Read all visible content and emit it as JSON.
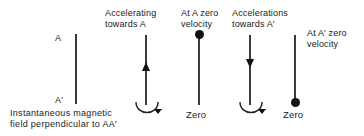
{
  "figure": {
    "type": "physics-oscillation-diagram",
    "background_color": "#ffffff",
    "line_color": "#3a3a3a",
    "marker_color": "#111111",
    "text_color": "#1a1a1a"
  },
  "caption": {
    "line1": "Instantaneous magnetic",
    "line2": "field perpendicular to AA′"
  },
  "axis_labels": {
    "top": "A",
    "bottom": "A′"
  },
  "stages": [
    {
      "id": "stage-1-reference",
      "top_label_line1": "",
      "top_label_line2": "",
      "marker": "none",
      "arrow": "none",
      "rotation_arrow": false,
      "bottom_label": ""
    },
    {
      "id": "stage-2-accelerating-towards-a",
      "top_label_line1": "Accelerating",
      "top_label_line2": "towards A",
      "marker": "none",
      "arrow": "up",
      "rotation_arrow": true,
      "bottom_label": ""
    },
    {
      "id": "stage-3-at-a-zero-velocity",
      "top_label_line1": "At A zero",
      "top_label_line2": "velocity",
      "marker": "dot-top",
      "arrow": "none",
      "rotation_arrow": false,
      "bottom_label": "Zero"
    },
    {
      "id": "stage-4-accelerations-towards-a-prime",
      "top_label_line1": "Accelerations",
      "top_label_line2": "towards A′",
      "marker": "none",
      "arrow": "down",
      "rotation_arrow": true,
      "bottom_label": ""
    },
    {
      "id": "stage-5-at-a-prime-zero-velocity",
      "top_label_line1": "At A′ zero",
      "top_label_line2": "velocity",
      "marker": "dot-bottom",
      "arrow": "none",
      "rotation_arrow": false,
      "bottom_label": "Zero"
    }
  ]
}
